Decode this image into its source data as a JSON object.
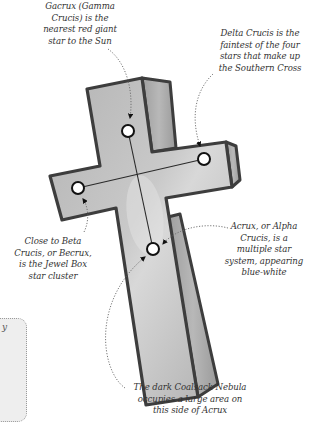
{
  "diagram": {
    "colors": {
      "cross_fill": "#b9b9b9",
      "cross_side": "#a3a3a3",
      "cross_outline": "#3d3d3d",
      "star_fill": "#ffffff",
      "star_outline": "#111111",
      "label_text": "#333333",
      "leader_line": "#555555"
    },
    "stars": [
      {
        "id": "gacrux",
        "name": "Gacrux (Gamma Crucis)",
        "x": 128,
        "y": 131
      },
      {
        "id": "delta-crucis",
        "name": "Delta Crucis",
        "x": 204,
        "y": 159
      },
      {
        "id": "becrux",
        "name": "Beta Crucis (Becrux)",
        "x": 78,
        "y": 188
      },
      {
        "id": "acrux",
        "name": "Acrux (Alpha Crucis)",
        "x": 153,
        "y": 249
      }
    ],
    "labels": {
      "gacrux": "Gacrux (Gamma\nCrucis) is the\nnearest red giant\nstar to the Sun",
      "delta": "Delta Crucis is the\nfaintest of the four\nstars that make up\nthe Southern Cross",
      "becrux": "Close to Beta\nCrucis, or Becrux,\nis the Jewel Box\nstar cluster",
      "acrux": "Acrux, or Alpha\nCrucis, is a\nmultiple star\nsystem, appearing\nblue-white",
      "coalsack": "The dark Coalsack Nebula\noccupies a large area on\nthis side of Acrux"
    },
    "side_panel": {
      "visible_text": "y"
    }
  }
}
